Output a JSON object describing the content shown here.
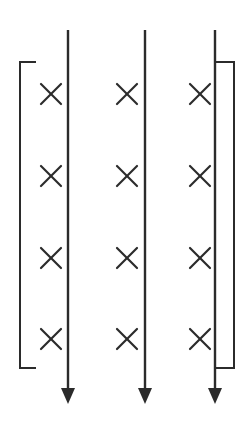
{
  "diagram": {
    "stroke_color": "#2b2b2b",
    "background": "#ffffff",
    "field": {
      "symbol": "×",
      "meaning": "magnetic field into page",
      "columns_x": [
        51,
        127,
        200
      ],
      "rows_y": [
        94,
        176,
        258,
        339
      ],
      "half_size": 10
    },
    "wires": [
      {
        "name": "left-wire",
        "x": 68,
        "y_top": 30,
        "y_bottom": 390,
        "direction": "down"
      },
      {
        "name": "middle-wire",
        "x": 145,
        "y_top": 30,
        "y_bottom": 390,
        "direction": "down"
      },
      {
        "name": "right-wire",
        "x": 215,
        "y_top": 30,
        "y_bottom": 390,
        "direction": "down"
      }
    ],
    "arrowhead": {
      "half_width": 7,
      "height": 16,
      "tip_y": 404
    },
    "brackets": [
      {
        "name": "left-bracket",
        "x": 20,
        "tick_end_x": 36,
        "y_top": 62,
        "y_bottom": 368
      },
      {
        "name": "right-bracket",
        "x_left": 215,
        "x_right": 234,
        "y_top": 62,
        "y_bottom": 368
      }
    ]
  }
}
